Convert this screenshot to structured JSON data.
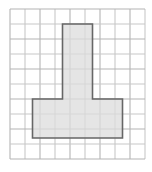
{
  "figure": {
    "name": "t-shape-on-grid",
    "background_color": "#ffffff"
  },
  "grid": {
    "name": "square-grid-paper",
    "origin_x": 10,
    "origin_y": 9,
    "cell_size": 15,
    "columns": 9,
    "rows": 10,
    "line_color": "#c8c8c8",
    "line_color_strong": "#b4b4b4",
    "line_width": 1.1
  },
  "shape": {
    "name": "t-polygon",
    "type": "polygon",
    "fill_color": "#dcdcdc",
    "fill_opacity": 0.75,
    "stroke_color": "#666666",
    "stroke_width": 1.6,
    "units": "grid cells",
    "vertices_cells": [
      [
        3.5,
        1.0
      ],
      [
        5.5,
        1.0
      ],
      [
        5.5,
        6.0
      ],
      [
        7.5,
        6.0
      ],
      [
        7.5,
        8.6
      ],
      [
        1.5,
        8.6
      ],
      [
        1.5,
        6.0
      ],
      [
        3.5,
        6.0
      ]
    ],
    "vertices_px": [
      [
        62.5,
        24.0
      ],
      [
        92.5,
        24.0
      ],
      [
        92.5,
        99.0
      ],
      [
        122.5,
        99.0
      ],
      [
        122.5,
        138.0
      ],
      [
        32.5,
        138.0
      ],
      [
        32.5,
        99.0
      ],
      [
        62.5,
        99.0
      ]
    ],
    "stem_width_cells": 2,
    "stem_height_cells": 5,
    "base_width_cells": 6,
    "base_height_cells": 2.6
  }
}
